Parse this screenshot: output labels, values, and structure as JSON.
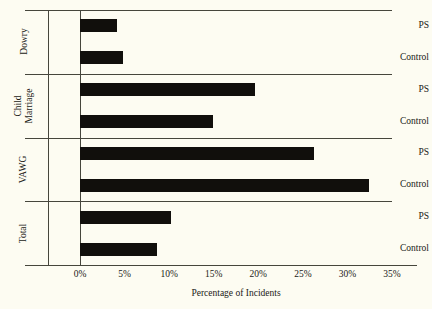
{
  "chart_data": {
    "type": "bar",
    "orientation": "horizontal",
    "title": "",
    "xlabel": "Percentage of Incidents",
    "ylabel": "",
    "xlim": [
      0,
      35
    ],
    "xticks": [
      "0%",
      "5%",
      "10%",
      "15%",
      "20%",
      "25%",
      "30%",
      "35%"
    ],
    "xtick_values": [
      0,
      5,
      10,
      15,
      20,
      25,
      30,
      35
    ],
    "grid": false,
    "legend": "none",
    "bar_color": "#110f0c",
    "background_color": "#fdfcf2",
    "groups": [
      {
        "name": "Dowry",
        "bars": [
          {
            "label": "PS",
            "value": 4.2
          },
          {
            "label": "Control",
            "value": 4.8
          }
        ]
      },
      {
        "name": "Child Marriage",
        "bars": [
          {
            "label": "PS",
            "value": 19.6
          },
          {
            "label": "Control",
            "value": 14.9
          }
        ]
      },
      {
        "name": "VAWG",
        "bars": [
          {
            "label": "PS",
            "value": 26.3
          },
          {
            "label": "Control",
            "value": 32.4
          }
        ]
      },
      {
        "name": "Total",
        "bars": [
          {
            "label": "PS",
            "value": 10.2
          },
          {
            "label": "Control",
            "value": 8.6
          }
        ]
      }
    ]
  }
}
